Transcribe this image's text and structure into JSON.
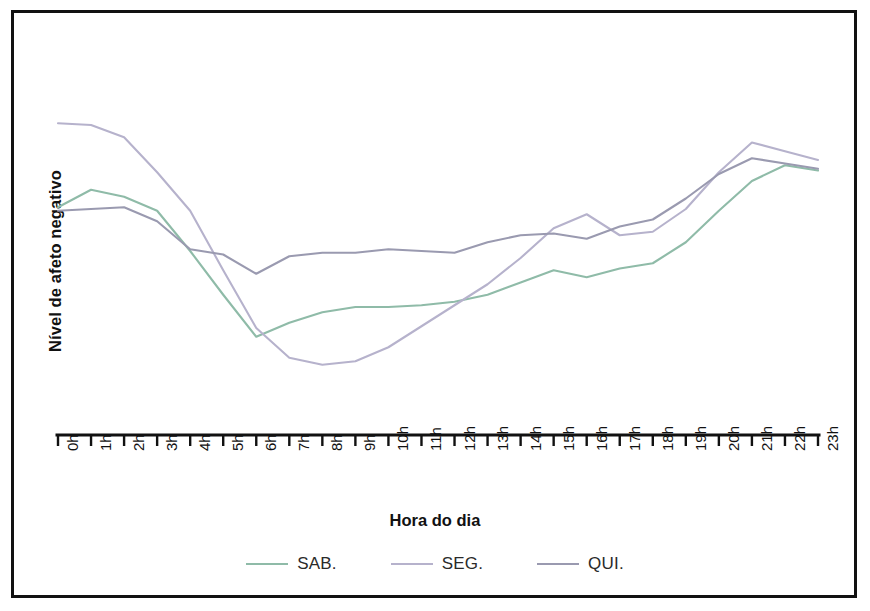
{
  "chart_data": {
    "type": "line",
    "title": "",
    "xlabel": "Hora do dia",
    "ylabel": "Nível de afeto negativo",
    "categories": [
      "0h",
      "1h",
      "2h",
      "3h",
      "4h",
      "5h",
      "6h",
      "7h",
      "8h",
      "9h",
      "10h",
      "11h",
      "12h",
      "13h",
      "14h",
      "15h",
      "16h",
      "17h",
      "18h",
      "19h",
      "20h",
      "21h",
      "22h",
      "23h"
    ],
    "x": [
      0,
      1,
      2,
      3,
      4,
      5,
      6,
      7,
      8,
      9,
      10,
      11,
      12,
      13,
      14,
      15,
      16,
      17,
      18,
      19,
      20,
      21,
      22,
      23
    ],
    "grid": false,
    "legend_position": "bottom",
    "ylim": [
      0,
      100
    ],
    "yticks_shown": false,
    "series": [
      {
        "name": "SAB.",
        "color": "#8fbba8",
        "values": [
          58.5,
          63.5,
          61.5,
          57.5,
          46.0,
          33.5,
          21.5,
          25.5,
          28.5,
          30.0,
          30.0,
          30.5,
          31.5,
          33.5,
          37.0,
          40.5,
          38.5,
          41.0,
          42.5,
          48.5,
          57.5,
          66.0,
          70.5,
          69.0
        ]
      },
      {
        "name": "SEG.",
        "color": "#b6b2cc",
        "values": [
          82.5,
          82.0,
          78.5,
          68.5,
          57.5,
          40.5,
          24.0,
          15.5,
          13.5,
          14.5,
          18.5,
          24.5,
          30.5,
          36.5,
          44.0,
          52.5,
          56.5,
          50.5,
          51.5,
          58.0,
          68.5,
          77.0,
          74.5,
          72.0
        ]
      },
      {
        "name": "QUI.",
        "color": "#9a9ab0",
        "values": [
          57.5,
          58.0,
          58.5,
          54.5,
          46.5,
          45.0,
          39.5,
          44.5,
          45.5,
          45.5,
          46.5,
          46.0,
          45.5,
          48.5,
          50.5,
          51.0,
          49.5,
          53.0,
          55.0,
          61.0,
          68.0,
          72.5,
          71.0,
          69.5
        ]
      }
    ]
  },
  "legend": {
    "items": [
      {
        "label": "SAB.",
        "color": "#8fbba8"
      },
      {
        "label": "SEG.",
        "color": "#b6b2cc"
      },
      {
        "label": "QUI.",
        "color": "#9a9ab0"
      }
    ]
  },
  "colors": {
    "frame": "#111111",
    "axis": "#111111",
    "background": "#ffffff"
  }
}
